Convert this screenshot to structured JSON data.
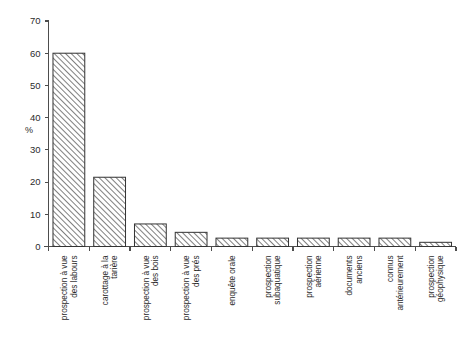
{
  "chart_data": {
    "type": "bar",
    "title": "",
    "xlabel": "",
    "ylabel": "%",
    "ylim": [
      0,
      70
    ],
    "yticks": [
      0,
      10,
      20,
      30,
      40,
      50,
      60,
      70
    ],
    "grid": false,
    "legend": null,
    "categories": [
      "prospection à vue des labours",
      "carottage à la tarière",
      "prospection à vue des bois",
      "prospection à vue des prés",
      "enquête orale",
      "prospection subaquatique",
      "prospection aérienne",
      "documents anciens",
      "connus antérieurement",
      "prospection géophysique"
    ],
    "category_lines": [
      [
        "prospection à vue",
        "des labours"
      ],
      [
        "carottage à la",
        "tarière"
      ],
      [
        "prospection à vue",
        "des bois"
      ],
      [
        "prospection à vue",
        "des prés"
      ],
      [
        "enquête orale"
      ],
      [
        "prospection",
        "subaquatique"
      ],
      [
        "prospection",
        "aérienne"
      ],
      [
        "documents",
        "anciens"
      ],
      [
        "connus",
        "antérieurement"
      ],
      [
        "prospection",
        "géophysique"
      ]
    ],
    "values": [
      60.0,
      21.5,
      7.0,
      4.4,
      2.6,
      2.6,
      2.6,
      2.6,
      2.6,
      1.3
    ]
  },
  "style": {
    "bar_fill": "#ffffff",
    "bar_hatch_color": "#3a3a3a",
    "bar_edge": "#333333",
    "axis_color": "#4d4d4d",
    "background": "#ffffff"
  }
}
